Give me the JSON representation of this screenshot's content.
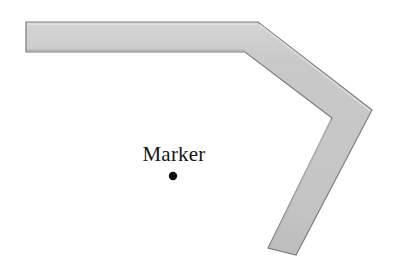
{
  "canvas": {
    "width": 394,
    "height": 273,
    "background": "#ffffff"
  },
  "figure": {
    "type": "bent-band-diagram",
    "band": {
      "name": "bent-band",
      "fill": "#c7c7c7",
      "stroke": "#7d7d7d",
      "stroke_width": 1.2,
      "thickness": 30,
      "centerline_points": "26,37 258,37 360,124 283,247",
      "outline_points": "26,22 258,22 372,110 296,255 268,248 332,118 245,52 26,52",
      "highlight_color": "#dcdcdc",
      "shadow_color": "#9a9a9a"
    },
    "marker": {
      "name": "marker",
      "label": "Marker",
      "dot_color": "#0d0d0d",
      "dot_radius": 4.2,
      "dot_x": 173,
      "dot_y": 176,
      "label_x": 173,
      "label_y": 160
    }
  }
}
